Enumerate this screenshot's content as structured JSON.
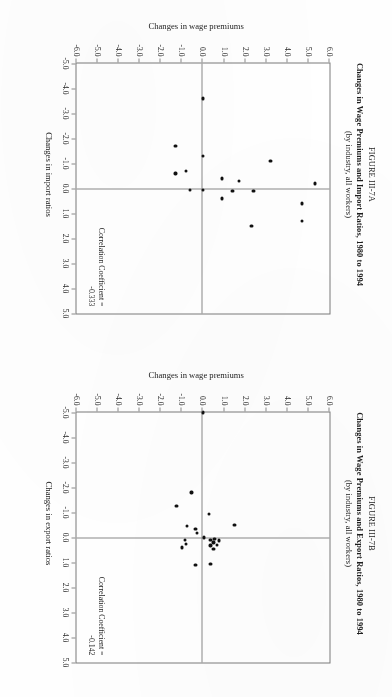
{
  "page": {
    "orientation_deg": 90,
    "background": "#fefefe"
  },
  "figures": [
    {
      "id": "fig-a",
      "label": "FIGURE III-7A",
      "title": "Changes in Wage Premiums and Import Ratios, 1980 to 1994",
      "subtitle": "(by industry, all workers)",
      "correlation_line1": "Correlation Coefficient =",
      "correlation_line2": "-0.333"
    },
    {
      "id": "fig-b",
      "label": "FIGURE III-7B",
      "title": "Changes in Wage Premiums and Export Ratios, 1980 to 1994",
      "subtitle": "(by industry, all workers)",
      "correlation_line1": "Correlation Coefficient =",
      "correlation_line2": "-0.142"
    }
  ],
  "chart_data": [
    {
      "id": "fig-a",
      "type": "scatter",
      "title": "Changes in Wage Premiums and Import Ratios, 1980 to 1994",
      "subtitle": "(by industry, all workers)",
      "figure_label": "FIGURE III-7A",
      "xlabel": "Changes in import ratios",
      "ylabel": "Changes in wage premiums",
      "xlim": [
        -5.0,
        5.0
      ],
      "ylim": [
        -6.0,
        6.0
      ],
      "xticks": [
        -5.0,
        -4.0,
        -3.0,
        -2.0,
        -1.0,
        0.0,
        1.0,
        2.0,
        3.0,
        4.0,
        5.0
      ],
      "yticks": [
        6.0,
        5.0,
        4.0,
        3.0,
        2.0,
        1.0,
        0.0,
        -1.0,
        -2.0,
        -3.0,
        -4.0,
        -5.0,
        -6.0
      ],
      "xticklabels": [
        "-5.0",
        "-4.0",
        "-3.0",
        "-2.0",
        "-1.0",
        "0.0",
        "1.0",
        "2.0",
        "3.0",
        "4.0",
        "5.0"
      ],
      "yticklabels": [
        "6.0",
        "5.0",
        "4.0",
        "3.0",
        "2.0",
        "1.0",
        "0.0",
        "-1.0",
        "-2.0",
        "-3.0",
        "-4.0",
        "-5.0",
        "-6.0"
      ],
      "grid": false,
      "legend": "none",
      "annotation": "Correlation Coefficient = -0.333",
      "correlation_coefficient": -0.333,
      "points": [
        {
          "x": -0.2,
          "y": 5.3
        },
        {
          "x": 0.6,
          "y": 4.7
        },
        {
          "x": 1.3,
          "y": 4.7
        },
        {
          "x": -1.1,
          "y": 3.2
        },
        {
          "x": 0.1,
          "y": 2.4
        },
        {
          "x": 1.5,
          "y": 2.3
        },
        {
          "x": -0.3,
          "y": 1.7
        },
        {
          "x": 0.1,
          "y": 1.4
        },
        {
          "x": -0.4,
          "y": 0.9
        },
        {
          "x": 0.4,
          "y": 0.9
        },
        {
          "x": -3.6,
          "y": 0.0
        },
        {
          "x": -1.3,
          "y": 0.0
        },
        {
          "x": 0.05,
          "y": 0.0
        },
        {
          "x": 0.05,
          "y": -0.6
        },
        {
          "x": -0.7,
          "y": -0.8
        },
        {
          "x": -1.7,
          "y": -1.3
        },
        {
          "x": -0.6,
          "y": -1.3
        }
      ]
    },
    {
      "id": "fig-b",
      "type": "scatter",
      "title": "Changes in Wage Premiums and Export Ratios, 1980 to 1994",
      "subtitle": "(by industry, all workers)",
      "figure_label": "FIGURE III-7B",
      "xlabel": "Changes in export ratios",
      "ylabel": "Changes in wage premiums",
      "xlim": [
        -5.0,
        5.0
      ],
      "ylim": [
        -6.0,
        6.0
      ],
      "xticks": [
        -5.0,
        -4.0,
        -3.0,
        -2.0,
        -1.0,
        0.0,
        1.0,
        2.0,
        3.0,
        4.0,
        5.0
      ],
      "yticks": [
        6.0,
        5.0,
        4.0,
        3.0,
        2.0,
        1.0,
        0.0,
        -1.0,
        -2.0,
        -3.0,
        -4.0,
        -5.0,
        -6.0
      ],
      "xticklabels": [
        "-5.0",
        "-4.0",
        "-3.0",
        "-2.0",
        "-1.0",
        "0.0",
        "1.0",
        "2.0",
        "3.0",
        "4.0",
        "5.0"
      ],
      "yticklabels": [
        "6.0",
        "5.0",
        "4.0",
        "3.0",
        "2.0",
        "1.0",
        "0.0",
        "-1.0",
        "-2.0",
        "-3.0",
        "-4.0",
        "-5.0",
        "-6.0"
      ],
      "grid": false,
      "legend": "none",
      "annotation": "Correlation Coefficient = -0.142",
      "correlation_coefficient": -0.142,
      "points": [
        {
          "x": -0.5,
          "y": 1.5
        },
        {
          "x": 0.12,
          "y": 0.75
        },
        {
          "x": 0.3,
          "y": 0.65
        },
        {
          "x": 0.05,
          "y": 0.55
        },
        {
          "x": 0.2,
          "y": 0.5
        },
        {
          "x": 0.45,
          "y": 0.5
        },
        {
          "x": 0.1,
          "y": 0.35
        },
        {
          "x": 0.32,
          "y": 0.35
        },
        {
          "x": -0.95,
          "y": 0.3
        },
        {
          "x": 1.05,
          "y": 0.35
        },
        {
          "x": -5.05,
          "y": 0.0
        },
        {
          "x": 0.0,
          "y": 0.05
        },
        {
          "x": -0.18,
          "y": -0.3
        },
        {
          "x": -0.35,
          "y": -0.35
        },
        {
          "x": 1.1,
          "y": -0.35
        },
        {
          "x": -1.8,
          "y": -0.55
        },
        {
          "x": -0.45,
          "y": -0.75
        },
        {
          "x": 0.1,
          "y": -0.85
        },
        {
          "x": 0.25,
          "y": -0.8
        },
        {
          "x": 0.4,
          "y": -1.0
        },
        {
          "x": -1.25,
          "y": -1.25
        }
      ]
    }
  ]
}
